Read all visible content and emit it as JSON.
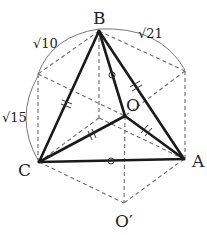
{
  "figure": {
    "type": "geometry-diagram",
    "points": {
      "B": {
        "label": "B",
        "x": 99,
        "y": 31
      },
      "O": {
        "label": "O",
        "x": 125,
        "y": 116
      },
      "C": {
        "label": "C",
        "x": 39,
        "y": 162
      },
      "A": {
        "label": "A",
        "x": 184,
        "y": 159
      },
      "O_prime": {
        "label": "O′",
        "x": 124,
        "y": 203
      },
      "TL": {
        "x": 38,
        "y": 74
      },
      "TR": {
        "x": 185,
        "y": 71
      },
      "inner": {
        "x": 99,
        "y": 118
      }
    },
    "lengths": {
      "arc_B_TL": "√10",
      "arc_B_TR": "√21",
      "arc_TL_C": "√15"
    },
    "equal_marks": {
      "double_tick": [
        "BC",
        "BA",
        "CO",
        "OA"
      ],
      "circle": [
        "BO",
        "CA"
      ]
    },
    "colors": {
      "solid": "#1a1a1a",
      "dashed": "#6a6a6a",
      "background": "#ffffff"
    }
  }
}
